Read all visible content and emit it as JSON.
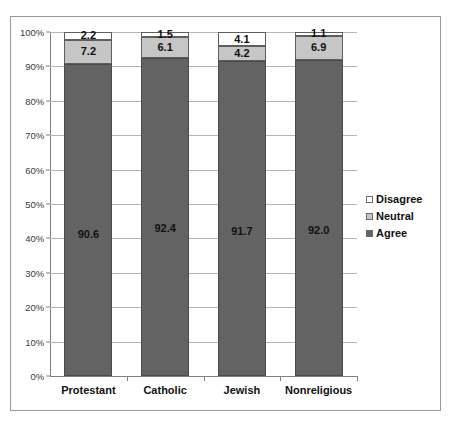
{
  "chart_data": {
    "type": "bar",
    "subtype": "stacked-100-percent",
    "title": "",
    "xlabel": "",
    "ylabel": "",
    "ylim": [
      0,
      100
    ],
    "ytick_labels": [
      "0%",
      "10%",
      "20%",
      "30%",
      "40%",
      "50%",
      "60%",
      "70%",
      "80%",
      "90%",
      "100%"
    ],
    "ytick_values": [
      0,
      10,
      20,
      30,
      40,
      50,
      60,
      70,
      80,
      90,
      100
    ],
    "grid": true,
    "legend_position": "right",
    "categories": [
      "Protestant",
      "Catholic",
      "Jewish",
      "Nonreligious"
    ],
    "series": [
      {
        "name": "Agree",
        "color": "#636363",
        "values": [
          90.6,
          92.4,
          91.7,
          92.0
        ],
        "labels": [
          "90.6",
          "92.4",
          "91.7",
          "92.0"
        ]
      },
      {
        "name": "Neutral",
        "color": "#c6c6c6",
        "values": [
          7.2,
          6.1,
          4.2,
          6.9
        ],
        "labels": [
          "7.2",
          "6.1",
          "4.2",
          "6.9"
        ]
      },
      {
        "name": "Disagree",
        "color": "#ffffff",
        "values": [
          2.2,
          1.5,
          4.1,
          1.1
        ],
        "labels": [
          "2.2",
          "1.5",
          "4.1",
          "1.1"
        ]
      }
    ],
    "legend_entries": [
      {
        "label": "Disagree",
        "swatch": "#ffffff"
      },
      {
        "label": "Neutral",
        "swatch": "#c6c6c6"
      },
      {
        "label": "Agree",
        "swatch": "#636363"
      }
    ]
  },
  "axis": {
    "ytick_0": "0%",
    "ytick_1": "10%",
    "ytick_2": "20%",
    "ytick_3": "30%",
    "ytick_4": "40%",
    "ytick_5": "50%",
    "ytick_6": "60%",
    "ytick_7": "70%",
    "ytick_8": "80%",
    "ytick_9": "90%",
    "ytick_10": "100%"
  }
}
